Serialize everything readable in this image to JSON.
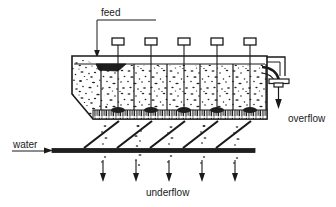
{
  "figure": {
    "type": "process-flow-diagram",
    "background_color": "#ffffff",
    "line_color": "#1a1a1a",
    "fill_slurry_color": "#2b2b2b",
    "width": 336,
    "height": 207
  },
  "labels": {
    "feed": "feed",
    "overflow": "overflow",
    "water": "water",
    "underflow": "underflow"
  },
  "flows": {
    "feed": {
      "label": "feed",
      "direction": "down",
      "entry": "top-left of tank"
    },
    "overflow": {
      "label": "overflow",
      "direction": "down",
      "exit": "right weir launder"
    },
    "water": {
      "label": "water",
      "direction": "right",
      "entry": "bottom manifold pipe"
    },
    "underflow": {
      "label": "underflow",
      "direction": "down",
      "exit": "five spigot discharges"
    }
  },
  "compartments": {
    "count": 5,
    "valve_rods": 5,
    "valve_box_label": ""
  },
  "arrows": {
    "underflow_count": 5,
    "overflow_count": 1,
    "feed_count": 1,
    "water_count": 1
  }
}
